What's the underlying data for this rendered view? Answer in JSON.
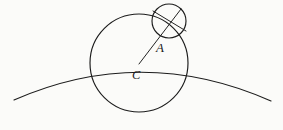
{
  "figure": {
    "kind": "geometry-diagram",
    "background_color": "#fbfbf9",
    "stroke_color": "#1c1c1c",
    "canvas": {
      "width": 283,
      "height": 130
    },
    "labels": [
      {
        "id": "A",
        "text": "A",
        "x": 156,
        "y": 41,
        "style": "italic-serif"
      },
      {
        "id": "C",
        "text": "C",
        "x": 132,
        "y": 69,
        "style": "italic-serif"
      }
    ],
    "shapes": {
      "ground_arc": {
        "name": "ground-arc",
        "type": "arc",
        "start": {
          "x": 14,
          "y": 100
        },
        "end": {
          "x": 271,
          "y": 101
        },
        "apex": {
          "x": 142,
          "y": 66
        }
      },
      "large_circle": {
        "name": "large-circle",
        "type": "circle",
        "center": {
          "x": 139,
          "y": 63
        },
        "radius": 49
      },
      "small_circle": {
        "name": "small-circle",
        "type": "circle",
        "center": {
          "x": 169,
          "y": 21
        },
        "radius": 17
      },
      "radius_line": {
        "name": "radius-line-c-to-a",
        "type": "segment",
        "from": {
          "x": 139,
          "y": 64
        },
        "to": {
          "x": 181,
          "y": 9
        }
      },
      "small_circle_chord": {
        "name": "small-circle-chord",
        "type": "segment",
        "from": {
          "x": 154,
          "y": 12
        },
        "to": {
          "x": 185,
          "y": 30
        }
      }
    }
  }
}
